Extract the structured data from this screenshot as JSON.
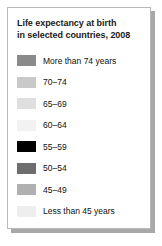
{
  "chart_data": {
    "type": "table",
    "title": "Life expectancy at birth in selected countries, 2008",
    "title_lines": [
      "Life expectancy at birth",
      "in selected countries, 2008"
    ],
    "legend_position": "standalone-card",
    "categories": [
      "More than 74 years",
      "70–74",
      "65–69",
      "60–64",
      "55–59",
      "50–54",
      "45–49",
      "Less than 45 years"
    ],
    "colors": [
      "#8a8a8a",
      "#c9c9c9",
      "#dfdfdf",
      "#f2f2f2",
      "#000000",
      "#6e6e6e",
      "#b0b0b0",
      "#eeeeee"
    ],
    "entries": [
      {
        "label": "More than 74 years",
        "color": "#8a8a8a"
      },
      {
        "label": "70–74",
        "color": "#c9c9c9"
      },
      {
        "label": "65–69",
        "color": "#dfdfdf"
      },
      {
        "label": "60–64",
        "color": "#f2f2f2"
      },
      {
        "label": "55–59",
        "color": "#000000"
      },
      {
        "label": "50–54",
        "color": "#6e6e6e"
      },
      {
        "label": "45–49",
        "color": "#b0b0b0"
      },
      {
        "label": "Less than 45 years",
        "color": "#eeeeee"
      }
    ],
    "xlabel": "",
    "ylabel": ""
  },
  "card": {
    "border_color": "#b9b9b9",
    "shadow_color": "#a8a8a8",
    "background": "#ffffff"
  }
}
